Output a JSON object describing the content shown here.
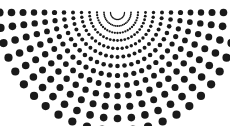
{
  "figure": {
    "type": "radial-dot-scatter",
    "width": 230,
    "height": 126,
    "background_color": "#ffffff",
    "dot_color": "#1a1a1a"
  },
  "chart_data": {
    "type": "scatter",
    "subtitle": "",
    "xlabel": "",
    "ylabel": "",
    "grid": false,
    "legend": null,
    "coordinate_system": "polar",
    "xlim": [
      0,
      230
    ],
    "ylim": [
      0,
      126
    ],
    "apex": {
      "x": 117.5,
      "y": 12.5
    },
    "angle_start_deg": 0,
    "angle_end_deg": 180,
    "ray_count": 25,
    "ray_angle_step_deg": 7.5,
    "rings_per_ray": 13,
    "ring_radii": [
      7,
      13.5,
      20.5,
      28,
      36,
      44.5,
      53.5,
      63,
      73,
      83.5,
      94.5,
      106,
      118
    ],
    "ring_dot_radii": [
      0.7,
      0.9,
      1.15,
      1.4,
      1.7,
      2.0,
      2.3,
      2.6,
      2.9,
      3.2,
      3.5,
      3.8,
      4.1
    ],
    "dot_color": "#1a1a1a",
    "max_radius_visible": 118,
    "total_dots_estimate": 260
  }
}
